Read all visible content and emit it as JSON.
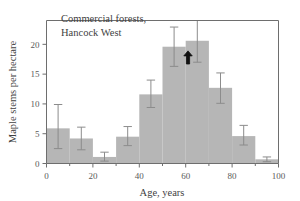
{
  "chart_data": {
    "type": "bar",
    "title": "",
    "annotation_lines": [
      "Commercial forests,",
      "Hancock West"
    ],
    "xlabel": "Age, years",
    "ylabel": "Maple stems per hectare",
    "xlim": [
      0,
      100
    ],
    "ylim": [
      0,
      24
    ],
    "xticks": [
      0,
      20,
      40,
      60,
      80,
      100
    ],
    "xticklabels": [
      "0",
      "20",
      "40",
      "60",
      "80",
      "100"
    ],
    "yticks": [
      0,
      5,
      10,
      15,
      20
    ],
    "yticklabels": [
      "0",
      "5",
      "10",
      "15",
      "20"
    ],
    "minor_xticks": [
      10,
      30,
      50,
      70,
      90
    ],
    "grid": false,
    "legend": "none",
    "bin_width": 10,
    "bin_starts": [
      0,
      10,
      20,
      30,
      40,
      50,
      60,
      70,
      80,
      90
    ],
    "bin_centers": [
      5,
      15,
      25,
      35,
      45,
      55,
      65,
      75,
      85,
      95
    ],
    "categories": [
      "0-10",
      "10-20",
      "20-30",
      "30-40",
      "40-50",
      "50-60",
      "60-70",
      "70-80",
      "80-90",
      "90-100"
    ],
    "values": [
      5.9,
      4.2,
      1.1,
      4.5,
      11.6,
      19.6,
      20.6,
      12.7,
      4.6,
      0.7
    ],
    "error_upper": [
      9.9,
      6.1,
      1.9,
      6.2,
      14.0,
      22.9,
      24.0,
      15.2,
      6.4,
      1.1
    ],
    "error_lower": [
      2.5,
      2.3,
      0.4,
      3.0,
      9.4,
      16.3,
      17.0,
      10.1,
      3.1,
      0.3
    ],
    "marker_annotations": [
      {
        "name": "up-arrow-marker",
        "x": 61,
        "y_tip": 18.9,
        "y_base": 16.7,
        "color": "#111111"
      }
    ],
    "colors": {
      "bar_fill": "#b6b6b6",
      "error_bar": "#8c8c8c",
      "axis": "#6e6e6e",
      "text": "#3f3f3f",
      "background": "#ffffff",
      "marker": "#111111"
    }
  }
}
